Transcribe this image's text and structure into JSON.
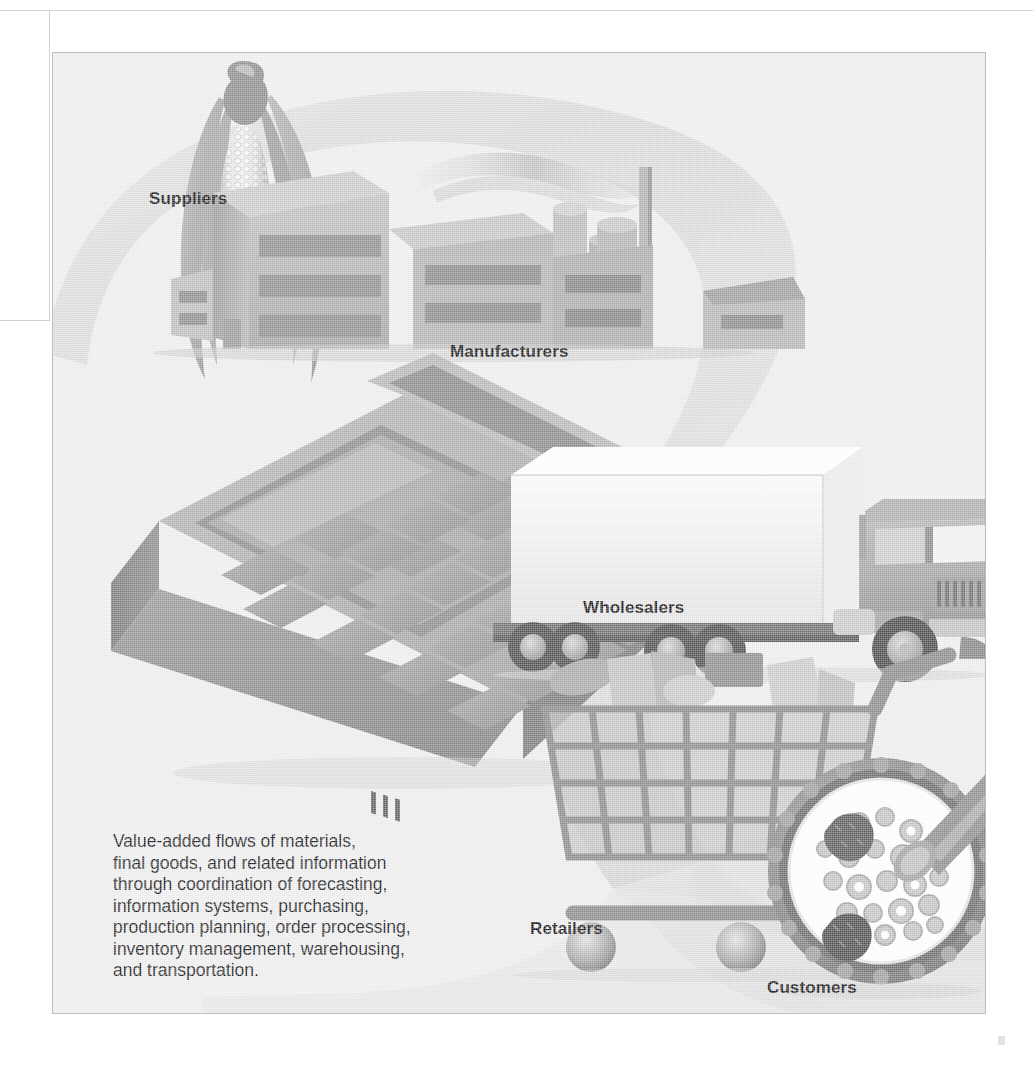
{
  "figure": {
    "background_color": "#eeeeee",
    "ribbon_color": "#dcdcdc",
    "ink_color": "#8f8f8f",
    "label_color": "#17171a",
    "nodes": [
      {
        "key": "suppliers",
        "label": "Suppliers",
        "icon": "corn-cob-icon"
      },
      {
        "key": "manufacturers",
        "label": "Manufacturers",
        "icon": "factory-icon"
      },
      {
        "key": "wholesalers",
        "label": "Wholesalers",
        "icon": "semi-truck-icon"
      },
      {
        "key": "retailers",
        "label": "Retailers",
        "icon": "shopping-cart-icon"
      },
      {
        "key": "customers",
        "label": "Customers",
        "icon": "cereal-bowl-icon"
      }
    ],
    "decorative_icons": [
      {
        "key": "calculator",
        "icon": "calculator-icon"
      }
    ],
    "caption": "Value-added flows of materials,\nfinal goods, and related information\nthrough coordination of forecasting,\ninformation systems, purchasing,\nproduction planning, order processing,\ninventory management, warehousing,\nand transportation."
  }
}
